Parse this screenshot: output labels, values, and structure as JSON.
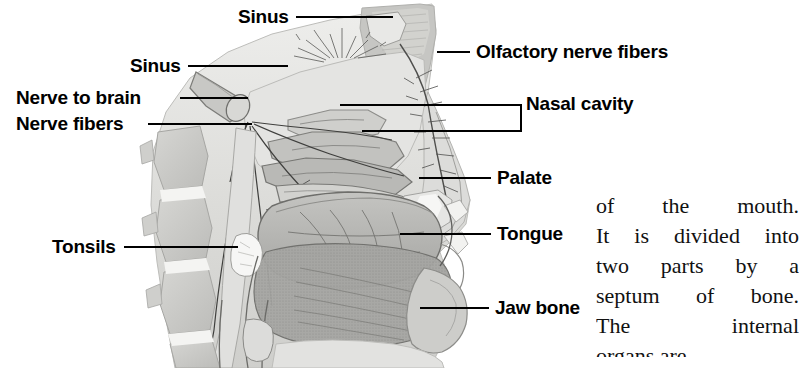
{
  "figure": {
    "type": "anatomical-diagram",
    "style": "grayscale medical illustration"
  },
  "labels": [
    {
      "id": "sinus-top",
      "text": "Sinus",
      "side": "left",
      "x": 238,
      "y": 7,
      "line": {
        "x1": 296,
        "y1": 17,
        "x2": 393,
        "y2": 17
      }
    },
    {
      "id": "sinus-second",
      "text": "Sinus",
      "side": "left",
      "x": 130,
      "y": 56,
      "line": {
        "x1": 188,
        "y1": 66,
        "x2": 288,
        "y2": 66
      }
    },
    {
      "id": "nerve-to-brain",
      "text": "Nerve to brain",
      "side": "left",
      "x": 16,
      "y": 88,
      "line": {
        "x1": 180,
        "y1": 98,
        "x2": 248,
        "y2": 98
      }
    },
    {
      "id": "nerve-fibers",
      "text": "Nerve fibers",
      "side": "left",
      "x": 16,
      "y": 114,
      "line": {
        "x1": 148,
        "y1": 124,
        "x2": 252,
        "y2": 124
      }
    },
    {
      "id": "tonsils",
      "text": "Tonsils",
      "side": "left",
      "x": 52,
      "y": 237,
      "line": {
        "x1": 124,
        "y1": 247,
        "x2": 238,
        "y2": 247
      }
    },
    {
      "id": "olfactory-nerve-fibers",
      "text": "Olfactory nerve fibers",
      "side": "right",
      "x": 476,
      "y": 42,
      "line": {
        "x1": 437,
        "y1": 52,
        "x2": 470,
        "y2": 52
      }
    },
    {
      "id": "nasal-cavity",
      "text": "Nasal cavity",
      "side": "right",
      "x": 526,
      "y": 94,
      "line": null
    },
    {
      "id": "palate",
      "text": "Palate",
      "side": "right",
      "x": 497,
      "y": 168,
      "line": {
        "x1": 419,
        "y1": 178,
        "x2": 491,
        "y2": 178
      }
    },
    {
      "id": "tongue",
      "text": "Tongue",
      "side": "right",
      "x": 497,
      "y": 224,
      "line": {
        "x1": 400,
        "y1": 234,
        "x2": 491,
        "y2": 234
      }
    },
    {
      "id": "jaw-bone",
      "text": "Jaw bone",
      "side": "right",
      "x": 495,
      "y": 298,
      "line": {
        "x1": 420,
        "y1": 308,
        "x2": 489,
        "y2": 308
      }
    }
  ],
  "nasal_cavity_bracket": {
    "top_line": {
      "x1": 340,
      "y1": 105,
      "x2": 521,
      "y2": 105
    },
    "bottom_line": {
      "x1": 362,
      "y1": 131,
      "x2": 521,
      "y2": 131
    },
    "vertical": {
      "x1": 521,
      "y1": 105,
      "x2": 521,
      "y2": 131
    },
    "stem": {
      "x1": 521,
      "y1": 105,
      "x2": 524,
      "y2": 105
    }
  },
  "body_text": {
    "lines": [
      "of the mouth.",
      "It is divided into",
      "two parts by a",
      "septum of bone.",
      "The internal"
    ],
    "partial_last_line": "organs are"
  },
  "colors": {
    "ink": "#000000",
    "text": "#111111",
    "background": "#ffffff",
    "tissue_light": "#e2e2e0",
    "tissue_mid": "#c9c9c6",
    "tissue_dark": "#a8a8a5",
    "muscle": "#9b9b98",
    "tongue": "#b5b5b2",
    "outline": "#4a4a48"
  }
}
